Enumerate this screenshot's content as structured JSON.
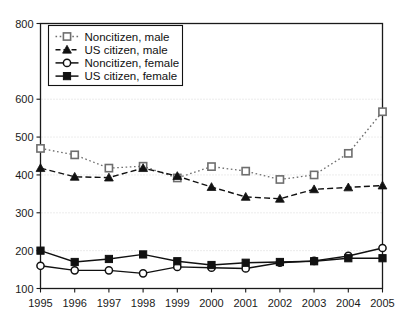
{
  "chart_data": {
    "type": "line",
    "title": "",
    "subtitle": "",
    "xlabel": "",
    "ylabel": "",
    "x": [
      1995,
      1996,
      1997,
      1998,
      1999,
      2000,
      2001,
      2002,
      2003,
      2004,
      2005
    ],
    "categories": [
      "1995",
      "1996",
      "1997",
      "1998",
      "1999",
      "2000",
      "2001",
      "2002",
      "2003",
      "2004",
      "2005"
    ],
    "xlim": [
      1995,
      2005
    ],
    "ylim": [
      100,
      800
    ],
    "yticks": [
      100,
      200,
      300,
      400,
      500,
      600,
      800
    ],
    "ytick_labels": [
      "100",
      "200",
      "300",
      "400",
      "500",
      "600",
      "800"
    ],
    "grid": "horizontal-dotted",
    "legend_position": "top-left",
    "series": [
      {
        "name": "Noncitizen, male",
        "marker": "open-square",
        "line": "dotted",
        "color": "#6e6e6e",
        "values": [
          470,
          453,
          418,
          423,
          392,
          422,
          410,
          388,
          400,
          457,
          567
        ]
      },
      {
        "name": "US citizen, male",
        "marker": "filled-triangle",
        "line": "dashed",
        "color": "#111111",
        "values": [
          418,
          395,
          393,
          418,
          397,
          368,
          342,
          337,
          362,
          367,
          372
        ]
      },
      {
        "name": "Noncitizen, female",
        "marker": "open-circle",
        "line": "solid",
        "color": "#111111",
        "values": [
          160,
          148,
          148,
          140,
          157,
          155,
          153,
          168,
          173,
          186,
          207
        ]
      },
      {
        "name": "US citizen, female",
        "marker": "filled-square",
        "line": "solid",
        "color": "#111111",
        "values": [
          200,
          170,
          178,
          190,
          172,
          162,
          168,
          170,
          172,
          180,
          180
        ]
      }
    ]
  },
  "axes": {
    "y_tick_labels": [
      "800",
      "600",
      "500",
      "400",
      "300",
      "200",
      "100"
    ],
    "x_tick_labels": [
      "1995",
      "1996",
      "1997",
      "1998",
      "1999",
      "2000",
      "2001",
      "2002",
      "2003",
      "2004",
      "2005"
    ]
  },
  "legend": {
    "entries": [
      {
        "label": "Noncitizen, male"
      },
      {
        "label": "US citizen, male"
      },
      {
        "label": "Noncitizen, female"
      },
      {
        "label": "US citizen, female"
      }
    ]
  }
}
